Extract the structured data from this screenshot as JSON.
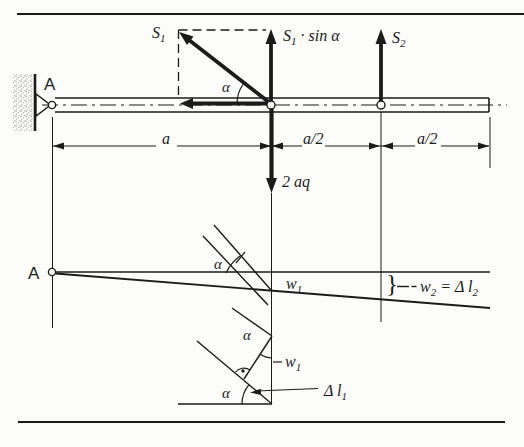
{
  "meta": {
    "background": "#fcfcfa",
    "ink": "#1b1b1b",
    "stipple_color": "#999990"
  },
  "top_figure": {
    "support_label": "A",
    "force_s1": {
      "base": "S",
      "sub": "1"
    },
    "force_s1_sin": {
      "base": "S",
      "sub": "1",
      "rest": " · sin α"
    },
    "force_s2": {
      "base": "S",
      "sub": "2"
    },
    "angle": "α",
    "load": "2 aq",
    "dim_a": "a",
    "dim_a2_left": "a/2",
    "dim_a2_right": "a/2"
  },
  "middle_figure": {
    "support_label": "A",
    "angle": "α",
    "w1": {
      "base": "w",
      "sub": "1"
    },
    "brace": "}",
    "w2": {
      "base": "w",
      "sub": "2",
      "mid": " = Δ ",
      "base2": "l",
      "sub2": "2"
    }
  },
  "bottom_figure": {
    "angle_top": "α",
    "angle_bottom": "α",
    "w1": {
      "base": "w",
      "sub": "1"
    },
    "delta_l1": {
      "base": "Δ l",
      "sub": "1"
    }
  }
}
